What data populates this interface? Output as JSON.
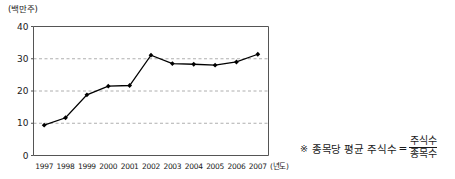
{
  "chart_data": {
    "type": "line",
    "title": "",
    "xlabel": "(년도)",
    "ylabel": "(백만주)",
    "categories": [
      "1997",
      "1998",
      "1999",
      "2000",
      "2001",
      "2002",
      "2003",
      "2004",
      "2005",
      "2006",
      "2007"
    ],
    "values": [
      9.4,
      11.7,
      18.8,
      21.5,
      21.7,
      31.1,
      28.5,
      28.3,
      28.0,
      29.0,
      31.4
    ],
    "series": [
      {
        "name": "종목당 평균 주식수",
        "values": [
          9.4,
          11.7,
          18.8,
          21.5,
          21.7,
          31.1,
          28.5,
          28.3,
          28.0,
          29.0,
          31.4
        ]
      }
    ],
    "ylim": [
      0,
      40
    ],
    "yticks": [
      0,
      10,
      20,
      30,
      40
    ],
    "ytick_labels": [
      "0",
      "10",
      "20",
      "30",
      "40"
    ],
    "grid": "horizontal-dashed",
    "legend": "none",
    "marker": "filled-diamond",
    "line_color": "#000000",
    "grid_color": "#9a9a9a"
  },
  "axes": {
    "y_unit_label": "(백만주)",
    "x_unit_label": "(년도)"
  },
  "note": {
    "mark": "※",
    "text": "종목당 평균 주식수",
    "equals": "=",
    "numerator": "주식수",
    "denominator": "종목수"
  }
}
